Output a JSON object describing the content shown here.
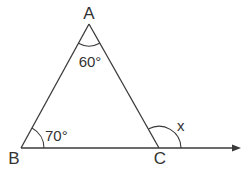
{
  "diagram": {
    "type": "triangle-exterior-angle",
    "colors": {
      "stroke": "#3a3a3a",
      "text": "#333333",
      "background": "#ffffff"
    },
    "vertices": {
      "A": {
        "label": "A",
        "x": 89,
        "y": 24
      },
      "B": {
        "label": "B",
        "x": 21,
        "y": 148
      },
      "C": {
        "label": "C",
        "x": 159,
        "y": 148
      }
    },
    "ray_end": {
      "x": 240,
      "y": 148
    },
    "angles": {
      "A": {
        "label": "60°",
        "value": 60
      },
      "B": {
        "label": "70°",
        "value": 70
      },
      "exterior_C": {
        "label": "x",
        "value": null
      }
    }
  }
}
